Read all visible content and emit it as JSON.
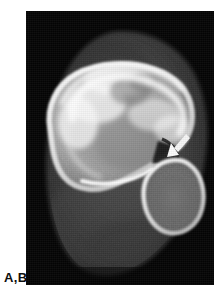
{
  "figure": {
    "label": "A,B",
    "modality": "CT",
    "panel": {
      "x": 26,
      "y": 11,
      "width": 188,
      "height": 274,
      "background_color": "#050505"
    },
    "page_background": "#ffffff",
    "annotations": [
      {
        "name": "arrow-marker",
        "glyph": "arrow-icon",
        "color": "#f2f2f2",
        "points_to": "cortical-defect",
        "x": 172,
        "y": 134,
        "width": 19,
        "height": 19,
        "direction": "down-left"
      }
    ],
    "structures": [
      {
        "name": "soft-tissue-envelope",
        "tone": "#3a3a3a"
      },
      {
        "name": "main-bone-cortex",
        "tone": "#f4f4f4"
      },
      {
        "name": "main-bone-trabecular",
        "tone": "#b9b9b9"
      },
      {
        "name": "secondary-bone-cortex",
        "tone": "#ededed"
      },
      {
        "name": "secondary-bone-marrow",
        "tone": "#6a6a6a"
      },
      {
        "name": "cortical-defect",
        "tone": "#1a1a1a"
      }
    ]
  },
  "palette": {
    "black": "#050505",
    "white": "#ffffff",
    "bone_bright": "#f6f6f6",
    "bone_mid": "#b0b0b0",
    "soft_tissue": "#3c3c3c",
    "label_text": "#0d0d0d"
  }
}
